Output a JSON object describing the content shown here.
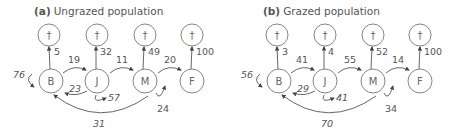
{
  "panels": [
    {
      "id": "a",
      "letter": "(a)",
      "title": "Ungrazed population",
      "nodes": {
        "B": "B",
        "J": "J",
        "M": "M",
        "F": "F",
        "death": "†"
      },
      "death_rates": {
        "B": "5",
        "J": "32",
        "M": "49",
        "F": "100"
      },
      "transitions": {
        "B_to_J": "19",
        "J_to_M": "11",
        "M_to_F": "20"
      },
      "loops": {
        "B_stay": "76",
        "J_stay": "57",
        "M_stay": "24"
      },
      "returns": {
        "J_to_B": "23",
        "M_to_B": "31"
      }
    },
    {
      "id": "b",
      "letter": "(b)",
      "title": "Grazed population",
      "nodes": {
        "B": "B",
        "J": "J",
        "M": "M",
        "F": "F",
        "death": "†"
      },
      "death_rates": {
        "B": "3",
        "J": "4",
        "M": "52",
        "F": "100"
      },
      "transitions": {
        "B_to_J": "41",
        "J_to_M": "55",
        "M_to_F": "14"
      },
      "loops": {
        "B_stay": "56",
        "J_stay": "41",
        "M_stay": "34"
      },
      "returns": {
        "J_to_B": "29",
        "M_to_B": "70"
      }
    }
  ]
}
